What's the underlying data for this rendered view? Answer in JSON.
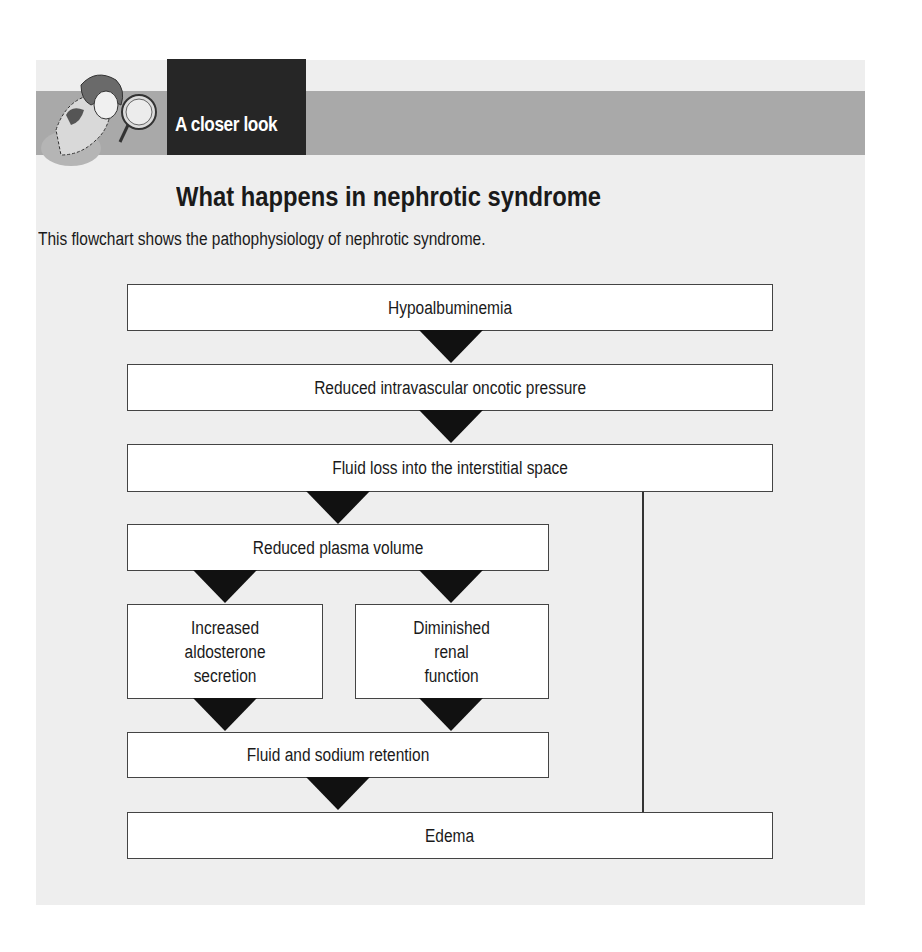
{
  "header": {
    "section_tag": "A closer look",
    "mascot_icon": "person-with-magnifying-glass-icon"
  },
  "title": "What happens in nephrotic syndrome",
  "subtitle": "This flowchart shows the pathophysiology of nephrotic syndrome.",
  "flowchart": {
    "nodes": [
      {
        "id": "n1",
        "label": "Hypoalbuminemia"
      },
      {
        "id": "n2",
        "label": "Reduced intravascular oncotic pressure"
      },
      {
        "id": "n3",
        "label": "Fluid loss into the interstitial space"
      },
      {
        "id": "n4",
        "label": "Reduced plasma volume"
      },
      {
        "id": "n5",
        "label": "Increased\naldosterone\nsecretion"
      },
      {
        "id": "n6",
        "label": "Diminished\nrenal\nfunction"
      },
      {
        "id": "n7",
        "label": "Fluid and sodium retention"
      },
      {
        "id": "n8",
        "label": "Edema"
      }
    ],
    "edges": [
      {
        "from": "n1",
        "to": "n2"
      },
      {
        "from": "n2",
        "to": "n3"
      },
      {
        "from": "n3",
        "to": "n4"
      },
      {
        "from": "n3",
        "to": "n8"
      },
      {
        "from": "n4",
        "to": "n5"
      },
      {
        "from": "n4",
        "to": "n6"
      },
      {
        "from": "n5",
        "to": "n7"
      },
      {
        "from": "n6",
        "to": "n7"
      },
      {
        "from": "n7",
        "to": "n8"
      }
    ]
  },
  "colors": {
    "panel_bg": "#eeeeee",
    "band": "#a9a9a9",
    "tag_bg": "#262626",
    "arrow": "#111111"
  }
}
